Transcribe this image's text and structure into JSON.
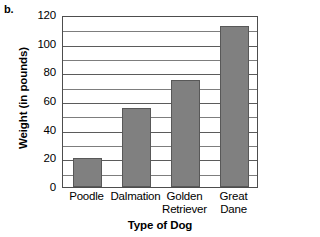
{
  "figure_label": "b.",
  "chart_data": {
    "type": "bar",
    "title": "",
    "categories": [
      "Poodle",
      "Dalmation",
      "Golden Retriever",
      "Great Dane"
    ],
    "category_lines": [
      [
        "Poodle",
        ""
      ],
      [
        "Dalmation",
        ""
      ],
      [
        "Golden",
        "Retriever"
      ],
      [
        "Great",
        "Dane"
      ]
    ],
    "values": [
      20,
      55,
      75,
      112
    ],
    "xlabel": "Type of Dog",
    "ylabel": "Weight (in pounds)",
    "ylim": [
      0,
      120
    ],
    "ytick_values": [
      0,
      20,
      40,
      60,
      80,
      100,
      120
    ],
    "ytick_labels": [
      "0",
      "20",
      "40",
      "60",
      "80",
      "100",
      "120"
    ],
    "minor_tick_step": 10,
    "grid": true,
    "legend": false,
    "bar_color": "#808080",
    "bar_edge_color": "#585858",
    "grid_color": "#7d7d7d",
    "axis_color": "#4d4d4d"
  }
}
